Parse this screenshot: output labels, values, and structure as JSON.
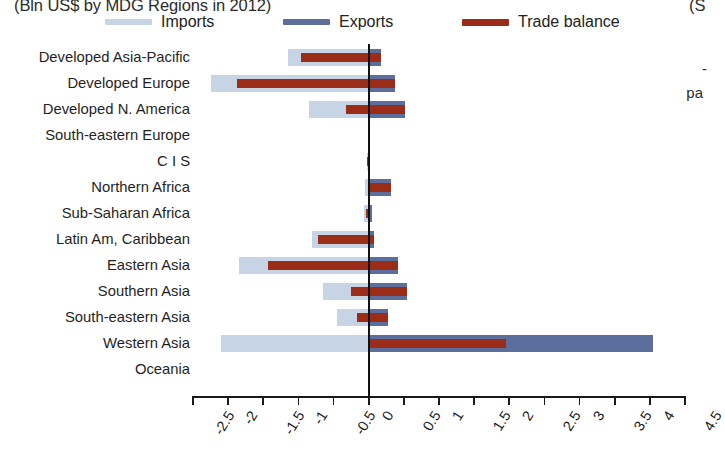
{
  "header": {
    "title_left": "(Bln US$ by MDG Regions in 2012)",
    "title_right": "(S",
    "side_note_1": "-",
    "side_note_2": "pa"
  },
  "legend": {
    "position": "top",
    "items": [
      {
        "label": "Imports",
        "color": "#c6d4e6",
        "key": "imports"
      },
      {
        "label": "Exports",
        "color": "#5b6e9c",
        "key": "exports"
      },
      {
        "label": "Trade balance",
        "color": "#9b2d18",
        "key": "balance"
      }
    ]
  },
  "axis": {
    "tick_labels": [
      "-2.5",
      "-2",
      "-1.5",
      "-1",
      "-0.5",
      "0",
      "0.5",
      "1",
      "1.5",
      "2",
      "2.5",
      "3",
      "3.5",
      "4",
      "4.5"
    ],
    "tick_values": [
      -2.5,
      -2,
      -1.5,
      -1,
      -0.5,
      0,
      0.5,
      1,
      1.5,
      2,
      2.5,
      3,
      3.5,
      4,
      4.5
    ],
    "xlim": [
      -2.5,
      4.5
    ],
    "zero_value": 0
  },
  "chart_data": {
    "type": "bar",
    "orientation": "horizontal",
    "title": "(Bln US$ by MDG Regions in 2012)",
    "xlabel": "",
    "ylabel": "",
    "xlim": [
      -2.5,
      4.5
    ],
    "xticks": [
      -2.5,
      -2,
      -1.5,
      -1,
      -0.5,
      0,
      0.5,
      1,
      1.5,
      2,
      2.5,
      3,
      3.5,
      4,
      4.5
    ],
    "grid": false,
    "legend": [
      "Imports",
      "Exports",
      "Trade balance"
    ],
    "legend_position": "top",
    "categories": [
      "Developed Asia-Pacific",
      "Developed Europe",
      "Developed N. America",
      "South-eastern Europe",
      "C I S",
      "Northern Africa",
      "Sub-Saharan Africa",
      "Latin Am, Caribbean",
      "Eastern Asia",
      "Southern Asia",
      "South-eastern Asia",
      "Western Asia",
      "Oceania"
    ],
    "series": [
      {
        "name": "Imports",
        "color": "#c6d4e6",
        "values": [
          -1.15,
          -2.25,
          -0.85,
          0,
          -0.02,
          -0.05,
          -0.06,
          -0.8,
          -1.85,
          -0.65,
          -0.45,
          -2.1,
          0
        ]
      },
      {
        "name": "Exports",
        "color": "#5b6e9c",
        "values": [
          0.18,
          0.38,
          0.52,
          0,
          0.02,
          0.32,
          0.04,
          0.08,
          0.42,
          0.55,
          0.28,
          4.05,
          0
        ]
      },
      {
        "name": "Trade balance",
        "color": "#9b2d18",
        "balance_spans": [
          [
            -0.97,
            0.18
          ],
          [
            -1.87,
            0.38
          ],
          [
            -0.33,
            0.52
          ],
          [
            0,
            0
          ],
          [
            -0.02,
            0.0
          ],
          [
            0.0,
            0.32
          ],
          [
            -0.04,
            0.02
          ],
          [
            -0.72,
            0.08
          ],
          [
            -1.43,
            0.42
          ],
          [
            -0.25,
            0.55
          ],
          [
            -0.17,
            0.28
          ],
          [
            0.0,
            1.95
          ],
          [
            0,
            0
          ]
        ],
        "values": [
          -0.97,
          -1.87,
          -0.33,
          0,
          -0.02,
          0.27,
          -0.04,
          -0.72,
          -1.43,
          -0.25,
          -0.17,
          1.95,
          0
        ]
      }
    ]
  }
}
